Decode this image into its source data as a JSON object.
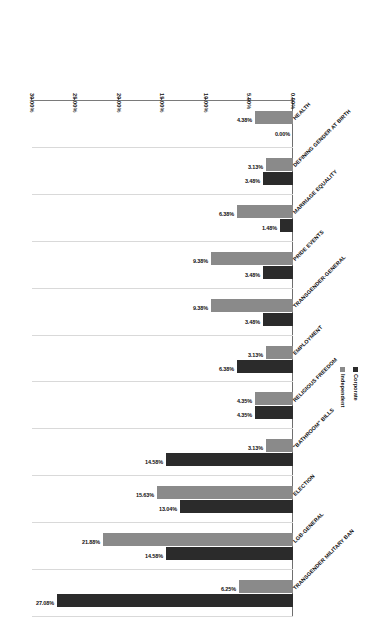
{
  "chart_data": {
    "type": "bar",
    "orientation": "horizontal",
    "title": "",
    "subtitle": "",
    "xlabel": "",
    "ylabel": "",
    "xlim": [
      0,
      30
    ],
    "xtick_labels": [
      "0.00%",
      "5.00%",
      "10.00%",
      "15.00%",
      "20.00%",
      "25.00%",
      "30.00%"
    ],
    "xtick_values": [
      0,
      5,
      10,
      15,
      20,
      25,
      30
    ],
    "grid": true,
    "legend_position": "right",
    "categories": [
      "TRANSGENDER MILITARY BAN",
      "LGB-GENERAL",
      "ELECTION",
      "\"BATHROOM\" BILLS",
      "RELIGIOUS FREEDOM",
      "EMPLOYMENT",
      "TRANSGENDER-GENERAL",
      "PRIDE EVENTS",
      "MARRIAGE EQUALITY",
      "DEFINING GENDER AT BIRTH",
      "HEALTH"
    ],
    "series": [
      {
        "name": "Corporate",
        "color": "#2b2b2b",
        "values": [
          27.08,
          14.58,
          13.04,
          14.58,
          4.35,
          6.38,
          3.48,
          3.48,
          1.48,
          3.48,
          0.0
        ],
        "labels": [
          "27.08%",
          "14.58%",
          "13.04%",
          "14.58%",
          "4.35%",
          "6.38%",
          "3.48%",
          "3.48%",
          "1.48%",
          "3.48%",
          "0.00%"
        ]
      },
      {
        "name": "Independent",
        "color": "#8a8a8a",
        "values": [
          6.25,
          21.88,
          15.63,
          3.13,
          4.35,
          3.13,
          9.38,
          9.38,
          6.38,
          3.13,
          4.38
        ],
        "labels": [
          "6.25%",
          "21.88%",
          "15.63%",
          "3.13%",
          "4.35%",
          "3.13%",
          "9.38%",
          "9.38%",
          "6.38%",
          "3.13%",
          "4.38%"
        ]
      }
    ],
    "legend": [
      "Corporate",
      "Independent"
    ]
  }
}
